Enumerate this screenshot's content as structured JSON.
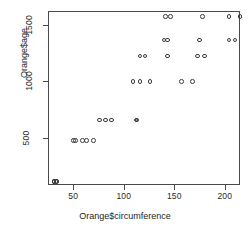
{
  "chart_data": {
    "type": "scatter",
    "title": "",
    "xlabel": "Orange$circumference",
    "ylabel": "Orange$age",
    "xlim": [
      25,
      215
    ],
    "ylim": [
      80,
      1620
    ],
    "grid": false,
    "legend": false,
    "point_symbol": "open-circle",
    "point_color": "#3a3a3a",
    "xticks": [
      50,
      100,
      150,
      200
    ],
    "yticks": [
      500,
      1000,
      1500
    ],
    "xtick_labels": [
      "50",
      "100",
      "150",
      "200"
    ],
    "ytick_labels": [
      "500",
      "1000",
      "1500"
    ],
    "n_points": 35,
    "x": [
      30,
      33,
      30,
      32,
      30,
      58,
      69,
      51,
      62,
      49,
      87,
      111,
      75,
      112,
      81,
      115,
      156,
      108,
      167,
      125,
      120,
      172,
      115,
      179,
      142,
      142,
      203,
      139,
      209,
      174,
      145,
      203,
      140,
      214,
      177
    ],
    "y": [
      118,
      118,
      118,
      118,
      118,
      484,
      484,
      484,
      484,
      484,
      664,
      664,
      664,
      664,
      664,
      1004,
      1004,
      1004,
      1004,
      1004,
      1231,
      1231,
      1231,
      1231,
      1231,
      1372,
      1372,
      1372,
      1372,
      1372,
      1582,
      1582,
      1582,
      1582,
      1582
    ],
    "series": [
      {
        "name": "Orange trees",
        "points": [
          {
            "x": 30,
            "y": 118
          },
          {
            "x": 33,
            "y": 118
          },
          {
            "x": 30,
            "y": 118
          },
          {
            "x": 32,
            "y": 118
          },
          {
            "x": 30,
            "y": 118
          },
          {
            "x": 58,
            "y": 484
          },
          {
            "x": 69,
            "y": 484
          },
          {
            "x": 51,
            "y": 484
          },
          {
            "x": 62,
            "y": 484
          },
          {
            "x": 49,
            "y": 484
          },
          {
            "x": 87,
            "y": 664
          },
          {
            "x": 111,
            "y": 664
          },
          {
            "x": 75,
            "y": 664
          },
          {
            "x": 112,
            "y": 664
          },
          {
            "x": 81,
            "y": 664
          },
          {
            "x": 115,
            "y": 1004
          },
          {
            "x": 156,
            "y": 1004
          },
          {
            "x": 108,
            "y": 1004
          },
          {
            "x": 167,
            "y": 1004
          },
          {
            "x": 125,
            "y": 1004
          },
          {
            "x": 120,
            "y": 1231
          },
          {
            "x": 172,
            "y": 1231
          },
          {
            "x": 115,
            "y": 1231
          },
          {
            "x": 179,
            "y": 1231
          },
          {
            "x": 142,
            "y": 1231
          },
          {
            "x": 142,
            "y": 1372
          },
          {
            "x": 203,
            "y": 1372
          },
          {
            "x": 139,
            "y": 1372
          },
          {
            "x": 209,
            "y": 1372
          },
          {
            "x": 174,
            "y": 1372
          },
          {
            "x": 145,
            "y": 1582
          },
          {
            "x": 203,
            "y": 1582
          },
          {
            "x": 140,
            "y": 1582
          },
          {
            "x": 214,
            "y": 1582
          },
          {
            "x": 177,
            "y": 1582
          }
        ]
      }
    ]
  }
}
